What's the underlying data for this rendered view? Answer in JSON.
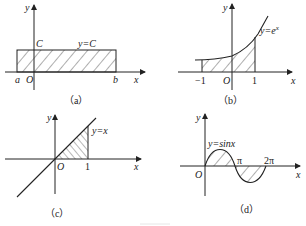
{
  "figure": {
    "panels": [
      {
        "id": "a",
        "caption": "（a）",
        "function_label": "y=C",
        "y_axis_label": "y",
        "x_axis_label": "x",
        "origin_label": "O",
        "height_label": "C",
        "left_bound_label": "a",
        "right_bound_label": "b"
      },
      {
        "id": "b",
        "caption": "（b）",
        "function_label": "y=e",
        "function_label_sup": "x",
        "y_axis_label": "y",
        "x_axis_label": "x",
        "origin_label": "O",
        "left_bound_label": "−1",
        "right_bound_label": "1"
      },
      {
        "id": "c",
        "caption": "（c）",
        "function_label": "y=x",
        "y_axis_label": "y",
        "x_axis_label": "x",
        "origin_label": "O",
        "right_bound_label": "1"
      },
      {
        "id": "d",
        "caption": "（d）",
        "function_label": "y=sinx",
        "y_axis_label": "y",
        "x_axis_label": "x",
        "origin_label": "O",
        "pi_label": "π",
        "two_pi_label": "2π"
      }
    ]
  }
}
